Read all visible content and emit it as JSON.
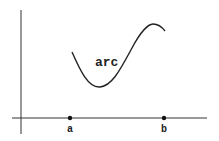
{
  "diagram": {
    "curve_label": "arc",
    "points": [
      {
        "label": "a"
      },
      {
        "label": "b"
      }
    ],
    "colors": {
      "stroke": "#222222",
      "axis": "#333333",
      "background": "#ffffff"
    }
  }
}
